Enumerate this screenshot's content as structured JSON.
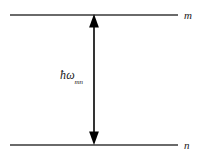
{
  "diagram": {
    "type": "energy-level-transition",
    "background_color": "#ffffff",
    "levels": [
      {
        "id": "upper",
        "label": "m",
        "y": 14,
        "color": "#6a6a6a"
      },
      {
        "id": "lower",
        "label": "n",
        "y": 144,
        "color": "#6a6a6a"
      }
    ],
    "arrow": {
      "direction": "double-headed-vertical",
      "color": "#000000",
      "x": 94,
      "y_top": 14,
      "y_bottom": 145
    },
    "energy_label": {
      "hbar": "ħ",
      "omega": "ω",
      "subscript": "mn",
      "full_text": "ħωmn",
      "color": "#1a1a1a"
    }
  }
}
